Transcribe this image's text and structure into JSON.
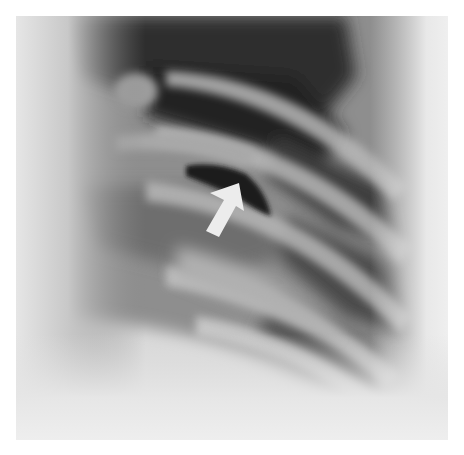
{
  "image": {
    "type": "radiograph",
    "description": "Chest X-ray, lateral rib region, with white arrow annotation",
    "background": "#ffffff"
  },
  "annotation": {
    "kind": "arrow",
    "color": "#ececec",
    "direction": "up-right"
  }
}
